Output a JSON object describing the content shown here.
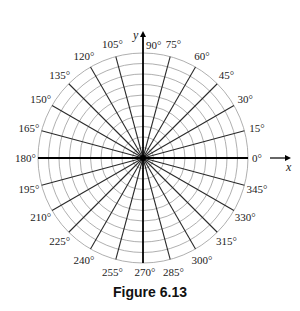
{
  "figure": {
    "caption": "Figure 6.13",
    "type": "polar-coordinate-grid",
    "center": {
      "x": 143,
      "y": 158
    },
    "outer_radius": 105,
    "circle_count": 10,
    "angle_step_deg": 15,
    "grid_color": "#9a9a9a",
    "ray_color": "#2a2a2a",
    "axis_color": "#000000",
    "axes": {
      "x_label": "x",
      "y_label": "y"
    },
    "angle_labels": [
      "0°",
      "15°",
      "30°",
      "45°",
      "60°",
      "75°",
      "90°",
      "105°",
      "120°",
      "135°",
      "150°",
      "165°",
      "180°",
      "195°",
      "210°",
      "225°",
      "240°",
      "255°",
      "270°",
      "285°",
      "300°",
      "315°",
      "330°",
      "345°"
    ]
  }
}
